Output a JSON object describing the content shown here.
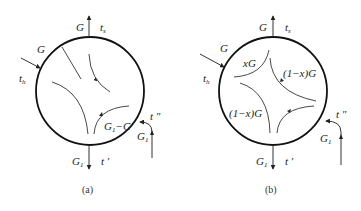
{
  "diagrams": [
    {
      "id": "a",
      "caption": "(a)",
      "labels": {
        "top_flow": "G",
        "top_temp": "t",
        "top_temp_sub": "s",
        "inlet_flow": "G",
        "inlet_temp": "t",
        "inlet_temp_sub": "h",
        "inner_mix": "G",
        "inner_mix_sub": "1",
        "inner_mix_rest": "−G",
        "recycle_temp": "t ″",
        "recycle_flow": "G",
        "recycle_flow_sub": "1",
        "bottom_flow": "G",
        "bottom_flow_sub": "1",
        "bottom_temp": "t ′"
      }
    },
    {
      "id": "b",
      "caption": "(b)",
      "labels": {
        "top_flow": "G",
        "top_temp": "t",
        "top_temp_sub": "s",
        "inlet_flow": "G",
        "inlet_temp": "t",
        "inlet_temp_sub": "h",
        "inner_xg": "xG",
        "inner_right": "(1−x)G",
        "inner_left": "(1−x)G",
        "recycle_temp": "t ″",
        "recycle_flow": "G",
        "recycle_flow_sub": "1",
        "bottom_flow": "G",
        "bottom_flow_sub": "1",
        "bottom_temp": "t ′"
      }
    }
  ]
}
